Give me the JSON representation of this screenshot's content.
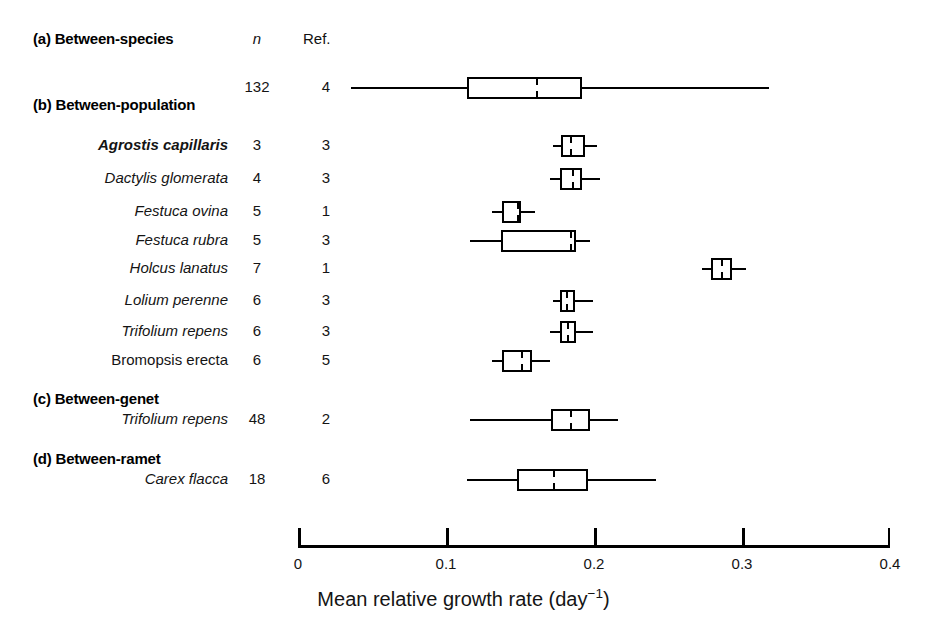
{
  "columns": {
    "n_label": "n",
    "ref_label": "Ref."
  },
  "sections": [
    {
      "id": "a",
      "label": "(a) Between-species"
    },
    {
      "id": "b",
      "label": "(b) Between-population"
    },
    {
      "id": "c",
      "label": "(c) Between-genet"
    },
    {
      "id": "d",
      "label": "(d) Between-ramet"
    }
  ],
  "axis": {
    "title_main": "Mean relative growth rate (day",
    "title_sup": "−1",
    "title_close": ")",
    "ticks": [
      "0",
      "0.1",
      "0.2",
      "0.3",
      "0.4"
    ],
    "tick_values": [
      0,
      0.1,
      0.2,
      0.3,
      0.4
    ],
    "min": 0,
    "max": 0.4
  },
  "chart_data": {
    "type": "box",
    "title": "",
    "xlabel": "Mean relative growth rate (day^-1)",
    "ylabel": "",
    "xlim": [
      0,
      0.4
    ],
    "xticks": [
      0,
      0.1,
      0.2,
      0.3,
      0.4
    ],
    "grid": false,
    "legend": "none",
    "columns": [
      "Taxon",
      "n",
      "Ref."
    ],
    "groups": [
      {
        "section": "(a) Between-species",
        "rows": [
          {
            "name": "",
            "name_style": "none",
            "n": "132",
            "ref": "4",
            "whisker_low": 0.036,
            "q1": 0.114,
            "median": 0.161,
            "q3": 0.192,
            "whisker_high": 0.318
          }
        ]
      },
      {
        "section": "(b) Between-population",
        "rows": [
          {
            "name": "Agrostis capillaris",
            "name_style": "bold-italic",
            "n": "3",
            "ref": "3",
            "whisker_low": 0.172,
            "q1": 0.178,
            "median": 0.184,
            "q3": 0.194,
            "whisker_high": 0.202
          },
          {
            "name": "Dactylis glomerata",
            "name_style": "italic",
            "n": "4",
            "ref": "3",
            "whisker_low": 0.17,
            "q1": 0.177,
            "median": 0.185,
            "q3": 0.192,
            "whisker_high": 0.204
          },
          {
            "name": "Festuca ovina",
            "name_style": "italic",
            "n": "5",
            "ref": "1",
            "whisker_low": 0.131,
            "q1": 0.138,
            "median": 0.148,
            "q3": 0.151,
            "whisker_high": 0.16
          },
          {
            "name": "Festuca rubra",
            "name_style": "italic",
            "n": "5",
            "ref": "3",
            "whisker_low": 0.116,
            "q1": 0.137,
            "median": 0.184,
            "q3": 0.188,
            "whisker_high": 0.197
          },
          {
            "name": "Holcus lanatus",
            "name_style": "italic",
            "n": "7",
            "ref": "1",
            "whisker_low": 0.273,
            "q1": 0.279,
            "median": 0.286,
            "q3": 0.293,
            "whisker_high": 0.303
          },
          {
            "name": "Lolium perenne",
            "name_style": "italic",
            "n": "6",
            "ref": "3",
            "whisker_low": 0.172,
            "q1": 0.177,
            "median": 0.181,
            "q3": 0.187,
            "whisker_high": 0.199
          },
          {
            "name": "Trifolium repens",
            "name_style": "italic",
            "n": "6",
            "ref": "3",
            "whisker_low": 0.17,
            "q1": 0.177,
            "median": 0.182,
            "q3": 0.188,
            "whisker_high": 0.199
          },
          {
            "name": "Bromopsis erecta",
            "name_style": "upright",
            "n": "6",
            "ref": "5",
            "whisker_low": 0.131,
            "q1": 0.138,
            "median": 0.151,
            "q3": 0.158,
            "whisker_high": 0.17
          }
        ]
      },
      {
        "section": "(c) Between-genet",
        "rows": [
          {
            "name": "Trifolium repens",
            "name_style": "italic",
            "n": "48",
            "ref": "2",
            "whisker_low": 0.116,
            "q1": 0.171,
            "median": 0.184,
            "q3": 0.197,
            "whisker_high": 0.216
          }
        ]
      },
      {
        "section": "(d) Between-ramet",
        "rows": [
          {
            "name": "Carex flacca",
            "name_style": "italic",
            "n": "18",
            "ref": "6",
            "whisker_low": 0.114,
            "q1": 0.148,
            "median": 0.172,
            "q3": 0.196,
            "whisker_high": 0.242
          }
        ]
      }
    ]
  }
}
